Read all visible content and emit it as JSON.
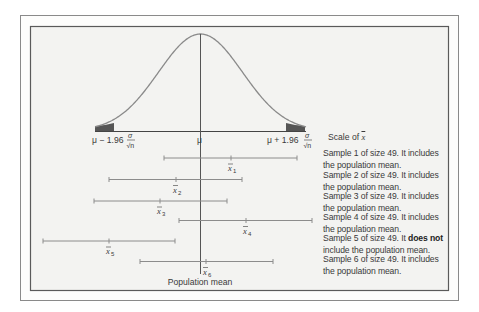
{
  "chart_data": {
    "type": "diagram",
    "title": "",
    "distribution": "normal",
    "axis": {
      "label": "Scale of x̄",
      "ticks": [
        {
          "label_main": "μ − 1.96",
          "label_frac_num": "σ",
          "label_frac_den": "√n",
          "position": "lower"
        },
        {
          "label_main": "μ",
          "position": "center"
        },
        {
          "label_main": "μ + 1.96",
          "label_frac_num": "σ",
          "label_frac_den": "√n",
          "position": "upper"
        }
      ],
      "shaded_tails": true
    },
    "center_line_label": "Population mean",
    "intervals": [
      {
        "sample": 1,
        "label": "x̄",
        "sub": "1",
        "lower": 164,
        "mean": 231,
        "upper": 297,
        "includes_mean": true
      },
      {
        "sample": 2,
        "label": "x̄",
        "sub": "2",
        "lower": 109,
        "mean": 176,
        "upper": 242,
        "includes_mean": true
      },
      {
        "sample": 3,
        "label": "x̄",
        "sub": "3",
        "lower": 94,
        "mean": 160,
        "upper": 227,
        "includes_mean": true
      },
      {
        "sample": 4,
        "label": "x̄",
        "sub": "4",
        "lower": 179,
        "mean": 246,
        "upper": 312,
        "includes_mean": true
      },
      {
        "sample": 5,
        "label": "x̄",
        "sub": "5",
        "lower": 43,
        "mean": 109,
        "upper": 175,
        "includes_mean": false
      },
      {
        "sample": 6,
        "label": "x̄",
        "sub": "6",
        "lower": 140,
        "mean": 206,
        "upper": 273,
        "includes_mean": true
      }
    ]
  },
  "labels": {
    "lower_bound_main": "μ − 1.96",
    "upper_bound_main": "μ + 1.96",
    "mu": "μ",
    "sigma": "σ",
    "sqrt_n": "√n",
    "scale_of_prefix": "Scale of ",
    "xbar": "x̄",
    "population_mean": "Population mean"
  },
  "legend": [
    {
      "line1": "Sample 1 of size 49. It includes",
      "line2": "the population mean."
    },
    {
      "line1": "Sample 2 of size 49. It includes",
      "line2": "the population mean."
    },
    {
      "line1": "Sample 3 of size 49. It includes",
      "line2": "the population mean."
    },
    {
      "line1": "Sample 4 of size 49. It includes",
      "line2": "the population mean."
    },
    {
      "line1_pre": "Sample 5 of size 49. It ",
      "line1_bold": "does not",
      "line2": "include the population mean."
    },
    {
      "line1": "Sample 6 of size 49. It includes",
      "line2": "the population mean."
    }
  ],
  "colors": {
    "frame": "#5a5a5a",
    "panel_bg": "#f3f3f1",
    "curve": "#8a8a8a",
    "tail_fill": "#555555",
    "interval": "#8c8c8c",
    "axis": "#444444"
  }
}
